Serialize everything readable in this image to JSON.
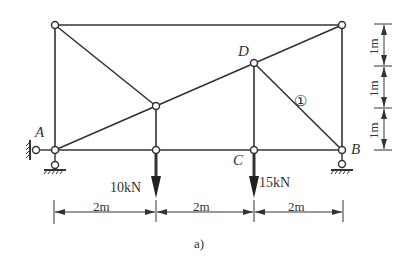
{
  "diagram": {
    "type": "plane-truss",
    "caption": "a)",
    "colors": {
      "line": "#333333",
      "background": "#ffffff"
    },
    "nodes": {
      "top_left": {
        "label": ""
      },
      "top_right": {
        "label": ""
      },
      "D": {
        "label": "D"
      },
      "mid": {
        "label": ""
      },
      "A": {
        "label": "A"
      },
      "bottom_mid": {
        "label": ""
      },
      "C": {
        "label": "C"
      },
      "B": {
        "label": "B"
      }
    },
    "member_label": "①",
    "supports": {
      "A": "pin support (horizontal + vertical links)",
      "B": "roller support"
    },
    "loads": [
      {
        "node": "bottom_mid",
        "label": "10kN"
      },
      {
        "node": "C",
        "label": "15kN"
      }
    ],
    "horizontal_dimensions": [
      "2m",
      "2m",
      "2m"
    ],
    "vertical_dimensions": [
      "1m",
      "1m",
      "1m"
    ]
  }
}
